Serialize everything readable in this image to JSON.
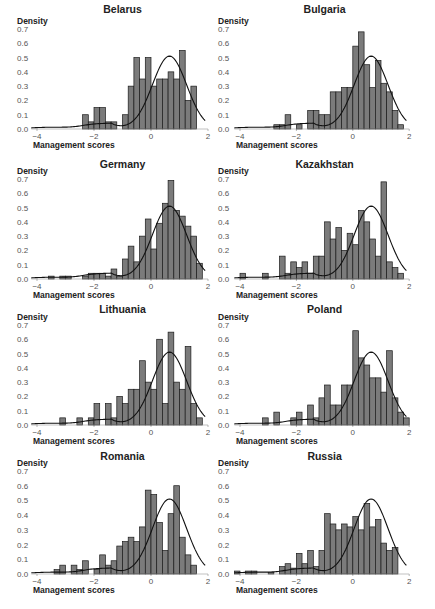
{
  "figure": {
    "ylabel": "Density",
    "xlabel": "Management scores",
    "bar_color": "#7b7b7b",
    "bar_edge": "#1a1a1a",
    "curve_color": "#111111"
  },
  "chart_data": [
    {
      "type": "bar",
      "title": "Belarus",
      "xlabel": "Management scores",
      "ylabel": "Density",
      "xlim": [
        -4,
        2
      ],
      "ylim": [
        0,
        0.7
      ],
      "xticks": [
        -4,
        -2,
        0,
        2
      ],
      "yticks": [
        0.0,
        0.1,
        0.2,
        0.3,
        0.4,
        0.5,
        0.6,
        0.7
      ],
      "bin_width": 0.2,
      "bin_start": -2.4,
      "values": [
        0.1,
        0.05,
        0.15,
        0.15,
        0.05,
        0.05,
        0,
        0.1,
        0.3,
        0.5,
        0.35,
        0.5,
        0.3,
        0.35,
        0.35,
        0.4,
        0.35,
        0.55,
        0.2,
        0.3
      ],
      "kde": "reference normal-like density peaking ~0.51 at 0.65"
    },
    {
      "type": "bar",
      "title": "Bulgaria",
      "xlabel": "Management scores",
      "ylabel": "Density",
      "xlim": [
        -4,
        2
      ],
      "ylim": [
        0,
        0.7
      ],
      "xticks": [
        -4,
        -2,
        0,
        2
      ],
      "yticks": [
        0.0,
        0.1,
        0.2,
        0.3,
        0.4,
        0.5,
        0.6,
        0.7
      ],
      "bin_width": 0.2,
      "bin_start": -2.8,
      "values": [
        0.03,
        0.03,
        0.1,
        0,
        0.03,
        0,
        0.13,
        0.13,
        0.1,
        0.1,
        0.26,
        0.26,
        0.29,
        0.29,
        0.58,
        0.68,
        0.45,
        0.29,
        0.48,
        0.32,
        0.26,
        0.13,
        0.03
      ],
      "kde": "reference normal-like density peaking ~0.51 at 0.65"
    },
    {
      "type": "bar",
      "title": "Germany",
      "xlabel": "Management scores",
      "ylabel": "Density",
      "xlim": [
        -4,
        2
      ],
      "ylim": [
        0,
        0.7
      ],
      "xticks": [
        -4,
        -2,
        0,
        2
      ],
      "yticks": [
        0.0,
        0.1,
        0.2,
        0.3,
        0.4,
        0.5,
        0.6,
        0.7
      ],
      "bin_width": 0.2,
      "bin_start": -3.6,
      "values": [
        0.02,
        0,
        0.02,
        0.02,
        0,
        0,
        0.02,
        0.04,
        0.04,
        0.04,
        0.02,
        0.07,
        0.02,
        0.14,
        0.23,
        0.12,
        0.3,
        0.42,
        0.21,
        0.39,
        0.53,
        0.69,
        0.48,
        0.44,
        0.37,
        0.3,
        0.11
      ],
      "kde": "reference normal-like density peaking ~0.52 at 0.65"
    },
    {
      "type": "bar",
      "title": "Kazakhstan",
      "xlabel": "Management scores",
      "ylabel": "Density",
      "xlim": [
        -4,
        2
      ],
      "ylim": [
        0,
        0.7
      ],
      "xticks": [
        -4,
        -2,
        0,
        2
      ],
      "yticks": [
        0.0,
        0.1,
        0.2,
        0.3,
        0.4,
        0.5,
        0.6,
        0.7
      ],
      "bin_width": 0.2,
      "bin_start": -4.0,
      "values": [
        0.04,
        0,
        0,
        0,
        0.04,
        0,
        0,
        0.16,
        0.04,
        0.12,
        0.08,
        0.12,
        0.04,
        0.16,
        0.16,
        0.4,
        0.28,
        0.36,
        0.2,
        0.32,
        0.24,
        0.48,
        0.4,
        0.28,
        0.16,
        0.68,
        0.12,
        0.08,
        0.04
      ],
      "kde": "reference normal-like density peaking ~0.52 at 0.65"
    },
    {
      "type": "bar",
      "title": "Lithuania",
      "xlabel": "Management scores",
      "ylabel": "Density",
      "xlim": [
        -4,
        2
      ],
      "ylim": [
        0,
        0.7
      ],
      "xticks": [
        -4,
        -2,
        0,
        2
      ],
      "yticks": [
        0.0,
        0.1,
        0.2,
        0.3,
        0.4,
        0.5,
        0.6,
        0.7
      ],
      "bin_width": 0.2,
      "bin_start": -3.2,
      "values": [
        0.05,
        0,
        0,
        0.05,
        0,
        0.05,
        0.15,
        0,
        0.15,
        0.05,
        0.2,
        0.15,
        0.25,
        0.25,
        0.45,
        0.3,
        0.25,
        0.6,
        0.15,
        0.65,
        0.3,
        0.25,
        0.55,
        0.15,
        0.05
      ],
      "kde": "reference normal-like density peaking ~0.52 at 0.65"
    },
    {
      "type": "bar",
      "title": "Poland",
      "xlabel": "Management scores",
      "ylabel": "Density",
      "xlim": [
        -4,
        2
      ],
      "ylim": [
        0,
        0.7
      ],
      "xticks": [
        -4,
        -2,
        0,
        2
      ],
      "yticks": [
        0.0,
        0.1,
        0.2,
        0.3,
        0.4,
        0.5,
        0.6,
        0.7
      ],
      "bin_width": 0.2,
      "bin_start": -3.2,
      "values": [
        0.05,
        0,
        0.09,
        0,
        0,
        0.05,
        0.09,
        0,
        0.14,
        0.05,
        0.19,
        0.28,
        0.14,
        0.14,
        0.28,
        0.28,
        0.66,
        0.47,
        0.42,
        0.33,
        0.33,
        0.23,
        0.52,
        0.19,
        0.09,
        0.05
      ],
      "kde": "reference normal-like density peaking ~0.52 at 0.65"
    },
    {
      "type": "bar",
      "title": "Romania",
      "xlabel": "Management scores",
      "ylabel": "Density",
      "xlim": [
        -4,
        2
      ],
      "ylim": [
        0,
        0.7
      ],
      "xticks": [
        -4,
        -2,
        0,
        2
      ],
      "yticks": [
        0.0,
        0.1,
        0.2,
        0.3,
        0.4,
        0.5,
        0.6,
        0.7
      ],
      "bin_width": 0.2,
      "bin_start": -3.4,
      "values": [
        0.03,
        0.06,
        0,
        0.06,
        0.03,
        0.09,
        0,
        0.03,
        0.13,
        0.06,
        0.09,
        0.19,
        0.22,
        0.25,
        0.22,
        0.32,
        0.57,
        0.54,
        0.35,
        0.16,
        0.41,
        0.6,
        0.25,
        0.13,
        0.06
      ],
      "kde": "reference normal-like density peaking ~0.51 at 0.65"
    },
    {
      "type": "bar",
      "title": "Russia",
      "xlabel": "Management scores",
      "ylabel": "Density",
      "xlim": [
        -4,
        2
      ],
      "ylim": [
        0,
        0.7
      ],
      "xticks": [
        -4,
        -2,
        0,
        2
      ],
      "yticks": [
        0.0,
        0.1,
        0.2,
        0.3,
        0.4,
        0.5,
        0.6,
        0.7
      ],
      "bin_width": 0.2,
      "bin_start": -4.2,
      "values": [
        0.02,
        0,
        0.02,
        0.02,
        0,
        0,
        0.01,
        0,
        0.05,
        0.07,
        0.04,
        0.14,
        0.07,
        0.16,
        0.05,
        0.16,
        0.41,
        0.34,
        0.3,
        0.34,
        0.32,
        0.39,
        0.3,
        0.48,
        0.32,
        0.37,
        0.21,
        0.16,
        0.18
      ],
      "kde": "reference normal-like density peaking ~0.51 at 0.65"
    }
  ]
}
